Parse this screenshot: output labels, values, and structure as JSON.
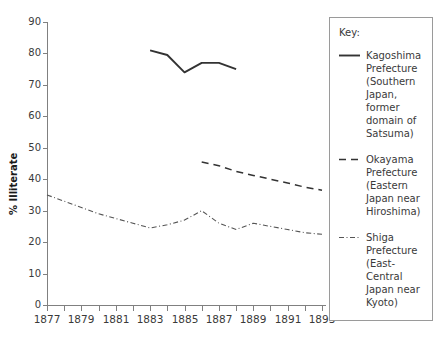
{
  "chart_data": {
    "type": "line",
    "title": "",
    "xlabel": "",
    "ylabel": "% Illiterate",
    "xlim": [
      1877,
      1893
    ],
    "ylim": [
      0,
      90
    ],
    "grid": false,
    "legend_position": "right",
    "legend_title": "Key:",
    "y_ticks": [
      0,
      10,
      20,
      30,
      40,
      50,
      60,
      70,
      80,
      90
    ],
    "x_ticks": [
      1877,
      1878,
      1879,
      1880,
      1881,
      1882,
      1883,
      1884,
      1885,
      1886,
      1887,
      1888,
      1889,
      1890,
      1891,
      1892,
      1893
    ],
    "x_tick_labels": [
      "1877",
      "",
      "1879",
      "",
      "1881",
      "",
      "1883",
      "",
      "1885",
      "",
      "1887",
      "",
      "1889",
      "",
      "1891",
      "",
      "1893"
    ],
    "series": [
      {
        "name": "kagoshima",
        "label": "Kagoshima Prefecture (Southern Japan, former domain of Satsuma)",
        "style": "solid",
        "color": "#333333",
        "x": [
          1883,
          1884,
          1885,
          1886,
          1887,
          1888
        ],
        "values": [
          81,
          79.5,
          74,
          77,
          77,
          75
        ]
      },
      {
        "name": "okayama",
        "label": "Okayama Prefecture (Eastern Japan near Hiroshima)",
        "style": "dashed",
        "color": "#333333",
        "x": [
          1886,
          1887,
          1888,
          1889,
          1890,
          1891,
          1892,
          1893
        ],
        "values": [
          45.5,
          44.3,
          42.5,
          41.2,
          40.0,
          38.8,
          37.5,
          36.5
        ]
      },
      {
        "name": "shiga",
        "label": "Shiga Prefecture (East-Central Japan near Kyoto)",
        "style": "dashdot",
        "color": "#555555",
        "x": [
          1877,
          1878,
          1879,
          1880,
          1881,
          1882,
          1883,
          1884,
          1885,
          1886,
          1887,
          1888,
          1889,
          1890,
          1891,
          1892,
          1893
        ],
        "values": [
          35,
          33,
          31,
          29,
          27.5,
          26,
          24.5,
          25.5,
          27,
          30,
          26,
          24,
          26,
          25,
          24,
          23,
          22.5
        ]
      }
    ]
  },
  "legend": {
    "title": "Key:",
    "entries": [
      {
        "swatch": "solid-line-swatch",
        "label": "Kagoshima Prefecture (Southern Japan, former domain of Satsuma)"
      },
      {
        "swatch": "dashed-line-swatch",
        "label": "Okayama Prefecture (Eastern Japan near Hiroshima)"
      },
      {
        "swatch": "dashdot-line-swatch",
        "label": "Shiga Prefecture (East-Central Japan near Kyoto)"
      }
    ]
  }
}
